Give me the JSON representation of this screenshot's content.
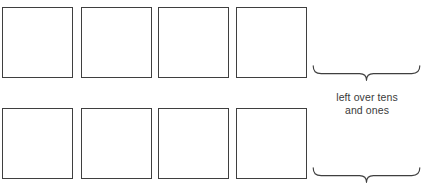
{
  "page": {
    "background_color": "#ffffff",
    "stroke_color": "#3f3f3f",
    "text_color": "#3a3a3a",
    "width": 427,
    "height": 186
  },
  "rows": [
    {
      "name": "top-row",
      "y": 7,
      "size": 71,
      "boxes": [
        {
          "label": "",
          "x": 2
        },
        {
          "label": "",
          "x": 81
        },
        {
          "label": "",
          "x": 158
        },
        {
          "label": "",
          "x": 236
        }
      ]
    },
    {
      "name": "bottom-row",
      "y": 108,
      "size": 71,
      "boxes": [
        {
          "label": "",
          "x": 2
        },
        {
          "label": "",
          "x": 81
        },
        {
          "label": "",
          "x": 158
        },
        {
          "label": "",
          "x": 236
        }
      ]
    }
  ],
  "braces": [
    {
      "name": "top-brace",
      "x": 312,
      "y": 65,
      "width": 109,
      "height": 21
    },
    {
      "name": "bottom-brace",
      "x": 312,
      "y": 167,
      "width": 109,
      "height": 21
    }
  ],
  "caption": {
    "line1": "left over tens",
    "line2": "and ones",
    "x": 312,
    "y": 91,
    "width": 110
  }
}
